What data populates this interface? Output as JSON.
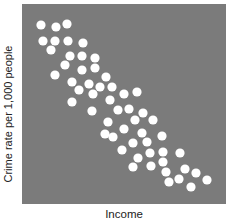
{
  "chart_data": {
    "type": "scatter",
    "title": "",
    "xlabel": "Income",
    "ylabel": "Crime rate per 1,000 people",
    "grid": false,
    "legend": null,
    "axis_ticks": "none shown",
    "xlim": [
      0,
      100
    ],
    "ylim": [
      0,
      100
    ],
    "note": "Values are relative positions (0-100) within the plot area; no tick values are shown. Strong negative correlation.",
    "colors": {
      "background": "#7b7b7b",
      "points": "#ffffff"
    },
    "series": [
      {
        "name": "observations",
        "points": [
          [
            9.3,
            89.5
          ],
          [
            16.7,
            88.5
          ],
          [
            22.1,
            90.0
          ],
          [
            10.3,
            81.5
          ],
          [
            16.2,
            81.5
          ],
          [
            22.5,
            81.5
          ],
          [
            29.9,
            80.5
          ],
          [
            14.2,
            77.0
          ],
          [
            23.5,
            74.0
          ],
          [
            29.4,
            74.0
          ],
          [
            35.8,
            73.0
          ],
          [
            21.1,
            69.5
          ],
          [
            29.4,
            67.0
          ],
          [
            35.8,
            68.0
          ],
          [
            16.2,
            64.5
          ],
          [
            41.2,
            63.5
          ],
          [
            24.5,
            61.0
          ],
          [
            32.8,
            60.0
          ],
          [
            38.2,
            58.5
          ],
          [
            44.1,
            58.5
          ],
          [
            27.9,
            57.0
          ],
          [
            34.8,
            55.0
          ],
          [
            50.0,
            55.0
          ],
          [
            56.4,
            56.0
          ],
          [
            43.1,
            52.0
          ],
          [
            24.5,
            51.0
          ],
          [
            34.3,
            46.5
          ],
          [
            47.1,
            47.0
          ],
          [
            52.5,
            47.5
          ],
          [
            59.3,
            45.5
          ],
          [
            42.2,
            41.0
          ],
          [
            55.4,
            42.0
          ],
          [
            64.2,
            42.0
          ],
          [
            50.0,
            37.5
          ],
          [
            58.8,
            35.5
          ],
          [
            40.7,
            35.0
          ],
          [
            44.6,
            33.5
          ],
          [
            68.6,
            34.0
          ],
          [
            54.4,
            30.5
          ],
          [
            61.3,
            31.0
          ],
          [
            49.0,
            27.0
          ],
          [
            62.7,
            25.5
          ],
          [
            69.1,
            26.0
          ],
          [
            77.5,
            25.5
          ],
          [
            56.9,
            23.0
          ],
          [
            69.1,
            21.0
          ],
          [
            63.2,
            19.0
          ],
          [
            54.4,
            18.5
          ],
          [
            70.6,
            16.0
          ],
          [
            79.9,
            17.5
          ],
          [
            85.3,
            15.5
          ],
          [
            77.0,
            12.5
          ],
          [
            72.1,
            11.0
          ],
          [
            90.7,
            12.0
          ],
          [
            82.8,
            8.5
          ]
        ]
      }
    ]
  },
  "render": {
    "point_radius": 4.6,
    "points_px": [
      [
        19,
        21
      ],
      [
        34,
        23
      ],
      [
        45,
        20
      ],
      [
        21,
        37
      ],
      [
        33,
        37
      ],
      [
        46,
        37
      ],
      [
        61,
        39
      ],
      [
        29,
        46
      ],
      [
        48,
        52
      ],
      [
        60,
        52
      ],
      [
        73,
        54
      ],
      [
        43,
        61
      ],
      [
        60,
        66
      ],
      [
        73,
        64
      ],
      [
        33,
        71
      ],
      [
        84,
        73
      ],
      [
        50,
        78
      ],
      [
        67,
        80
      ],
      [
        78,
        83
      ],
      [
        90,
        83
      ],
      [
        57,
        86
      ],
      [
        71,
        90
      ],
      [
        102,
        90
      ],
      [
        115,
        88
      ],
      [
        88,
        96
      ],
      [
        50,
        98
      ],
      [
        70,
        107
      ],
      [
        96,
        106
      ],
      [
        107,
        105
      ],
      [
        121,
        109
      ],
      [
        86,
        118
      ],
      [
        113,
        116
      ],
      [
        131,
        116
      ],
      [
        102,
        125
      ],
      [
        120,
        129
      ],
      [
        83,
        130
      ],
      [
        91,
        133
      ],
      [
        140,
        132
      ],
      [
        111,
        139
      ],
      [
        125,
        138
      ],
      [
        100,
        146
      ],
      [
        128,
        149
      ],
      [
        141,
        148
      ],
      [
        158,
        149
      ],
      [
        116,
        154
      ],
      [
        141,
        158
      ],
      [
        129,
        162
      ],
      [
        111,
        163
      ],
      [
        144,
        168
      ],
      [
        163,
        165
      ],
      [
        174,
        169
      ],
      [
        157,
        175
      ],
      [
        147,
        178
      ],
      [
        185,
        176
      ],
      [
        169,
        183
      ]
    ]
  }
}
